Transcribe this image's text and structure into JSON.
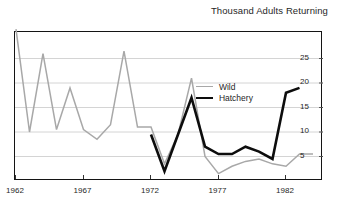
{
  "chart": {
    "title": "Thousand Adults Returning",
    "x_ticks": [
      "1962",
      "1967",
      "1972",
      "1977",
      "1982"
    ],
    "y_ticks": [
      "5",
      "10",
      "15",
      "20",
      "25"
    ],
    "legend": {
      "position": "inside-right-upper",
      "entries": [
        {
          "label": "Wild",
          "swatch": "thin-gray-line",
          "color": "#a8a8a8"
        },
        {
          "label": "Hatchery",
          "swatch": "thick-black-line",
          "color": "#0d0d0d"
        }
      ]
    },
    "colors": {
      "wild": "#a8a8a8",
      "hatchery": "#0d0d0d",
      "grid": "#c9c9c9",
      "frame": "#141414"
    }
  },
  "chart_data": {
    "type": "line",
    "title": "Thousand Adults Returning",
    "xlabel": "",
    "ylabel": "Thousand Adults Returning",
    "xlim": [
      1962,
      1984
    ],
    "ylim": [
      0,
      28
    ],
    "yticks": [
      5,
      10,
      15,
      20,
      25
    ],
    "xticks": [
      1962,
      1967,
      1972,
      1977,
      1982
    ],
    "grid": "horizontal",
    "legend_position": "inside-right-upper",
    "x": [
      1962,
      1963,
      1964,
      1965,
      1966,
      1967,
      1968,
      1969,
      1970,
      1971,
      1972,
      1973,
      1974,
      1975,
      1976,
      1977,
      1978,
      1979,
      1980,
      1981,
      1982,
      1983,
      1984
    ],
    "series": [
      {
        "name": "Wild",
        "color": "#a8a8a8",
        "style": "thin-gray",
        "values": [
          31,
          10,
          26,
          10.5,
          19,
          10.5,
          8.5,
          11.5,
          26.5,
          11,
          11,
          3.5,
          9.5,
          21,
          5,
          1.5,
          3,
          4,
          4.5,
          3.5,
          3,
          5.5,
          5.5
        ]
      },
      {
        "name": "Hatchery",
        "color": "#0d0d0d",
        "style": "thick-black",
        "start_year": 1972,
        "values": [
          null,
          null,
          null,
          null,
          null,
          null,
          null,
          null,
          null,
          null,
          9.5,
          2,
          9.5,
          17,
          7,
          5.5,
          5.5,
          7,
          6,
          4.5,
          18,
          19,
          null
        ]
      }
    ]
  }
}
